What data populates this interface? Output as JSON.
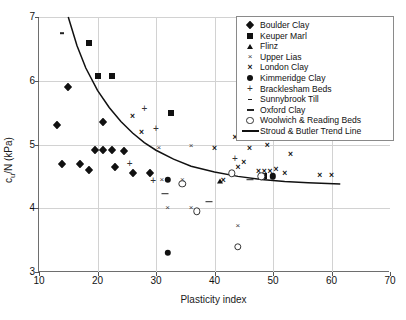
{
  "chart_data": {
    "type": "scatter",
    "title": "",
    "xlabel": "Plasticity index",
    "ylabel": "c_u/N (kPa)",
    "ylabel_main": "c",
    "ylabel_sub": "u",
    "ylabel_rest": "/N (kPa)",
    "xlim": [
      10,
      70
    ],
    "ylim": [
      3,
      7
    ],
    "xticks": [
      10,
      20,
      30,
      40,
      50,
      60,
      70
    ],
    "yticks": [
      3,
      4,
      5,
      6,
      7
    ],
    "grid": true,
    "legend_position": "top-right",
    "series": [
      {
        "name": "Boulder Clay",
        "marker": "diamond",
        "points": [
          [
            13.0,
            5.3
          ],
          [
            15.0,
            5.9
          ],
          [
            14.0,
            4.7
          ],
          [
            17.0,
            4.7
          ],
          [
            21.0,
            5.35
          ],
          [
            23.0,
            4.65
          ],
          [
            19.5,
            4.92
          ],
          [
            21.0,
            4.92
          ],
          [
            22.5,
            4.92
          ],
          [
            24.5,
            4.9
          ],
          [
            18.5,
            4.6
          ],
          [
            26.0,
            4.55
          ],
          [
            29.0,
            4.55
          ]
        ]
      },
      {
        "name": "Keuper Marl",
        "marker": "square",
        "points": [
          [
            18.5,
            6.6
          ],
          [
            20.0,
            6.08
          ],
          [
            22.5,
            6.08
          ],
          [
            32.5,
            5.5
          ],
          [
            48.5,
            4.5
          ]
        ]
      },
      {
        "name": "Flinz",
        "marker": "triangle",
        "points": [
          [
            41.0,
            4.42
          ]
        ]
      },
      {
        "name": "Upper Lias",
        "marker": "cross-thin",
        "points": [
          [
            30.5,
            4.95
          ],
          [
            36.0,
            4.98
          ],
          [
            31.0,
            4.45
          ],
          [
            34.5,
            4.45
          ],
          [
            32.0,
            4.0
          ],
          [
            36.0,
            4.0
          ],
          [
            44.0,
            3.72
          ]
        ]
      },
      {
        "name": "London Clay",
        "marker": "cross-bold",
        "points": [
          [
            26.0,
            5.45
          ],
          [
            27.5,
            5.2
          ],
          [
            40.0,
            4.95
          ],
          [
            46.0,
            4.95
          ],
          [
            43.5,
            5.12
          ],
          [
            45.0,
            4.72
          ],
          [
            49.0,
            5.0
          ],
          [
            53.0,
            4.85
          ],
          [
            47.5,
            4.58
          ],
          [
            48.5,
            4.58
          ],
          [
            49.5,
            4.58
          ],
          [
            52.0,
            4.55
          ],
          [
            58.0,
            4.52
          ],
          [
            60.0,
            4.52
          ],
          [
            50.5,
            4.62
          ],
          [
            44.0,
            4.65
          ],
          [
            41.5,
            4.45
          ]
        ]
      },
      {
        "name": "Kimmeridge Clay",
        "marker": "circle-filled",
        "points": [
          [
            32.0,
            4.45
          ],
          [
            32.0,
            3.3
          ],
          [
            50.0,
            4.5
          ]
        ]
      },
      {
        "name": "Bracklesham Beds",
        "marker": "plus",
        "points": [
          [
            28.0,
            5.55
          ],
          [
            29.5,
            4.42
          ],
          [
            25.5,
            4.7
          ],
          [
            30.0,
            5.25
          ],
          [
            43.5,
            4.78
          ]
        ]
      },
      {
        "name": "Sunnybrook Till",
        "marker": "dash-small",
        "points": [
          [
            14.0,
            6.75
          ]
        ]
      },
      {
        "name": "Oxford Clay",
        "marker": "dash-large",
        "points": [
          [
            31.5,
            4.23
          ],
          [
            39.0,
            4.1
          ],
          [
            46.0,
            4.45
          ]
        ]
      },
      {
        "name": "Woolwich & Reading Beds",
        "marker": "circle-open",
        "points": [
          [
            34.5,
            4.38
          ],
          [
            37.0,
            3.95
          ],
          [
            43.0,
            4.55
          ],
          [
            44.0,
            3.4
          ],
          [
            48.0,
            4.5
          ]
        ]
      },
      {
        "name": "Stroud & Butler Trend Line",
        "marker": "line",
        "is_line": true,
        "points": [
          [
            15.0,
            7.0
          ],
          [
            16.5,
            6.55
          ],
          [
            18.0,
            6.2
          ],
          [
            20.0,
            5.85
          ],
          [
            22.0,
            5.58
          ],
          [
            24.0,
            5.36
          ],
          [
            26.0,
            5.18
          ],
          [
            28.0,
            5.03
          ],
          [
            30.0,
            4.91
          ],
          [
            33.0,
            4.77
          ],
          [
            36.0,
            4.66
          ],
          [
            40.0,
            4.57
          ],
          [
            44.0,
            4.5
          ],
          [
            48.0,
            4.45
          ],
          [
            52.0,
            4.42
          ],
          [
            56.0,
            4.4
          ],
          [
            61.5,
            4.38
          ]
        ]
      }
    ],
    "legend_entries": [
      {
        "label": "Boulder Clay",
        "marker": "diamond"
      },
      {
        "label": "Keuper Marl",
        "marker": "square"
      },
      {
        "label": "Flinz",
        "marker": "triangle"
      },
      {
        "label": "Upper Lias",
        "marker": "cross-thin"
      },
      {
        "label": "London Clay",
        "marker": "cross-bold"
      },
      {
        "label": "Kimmeridge Clay",
        "marker": "circle-filled"
      },
      {
        "label": "Bracklesham Beds",
        "marker": "plus"
      },
      {
        "label": "Sunnybrook Till",
        "marker": "dash-small"
      },
      {
        "label": "Oxford Clay",
        "marker": "dash-large"
      },
      {
        "label": "Woolwich & Reading Beds",
        "marker": "circle-open"
      },
      {
        "label": "Stroud & Butler Trend Line",
        "marker": "line"
      }
    ]
  }
}
